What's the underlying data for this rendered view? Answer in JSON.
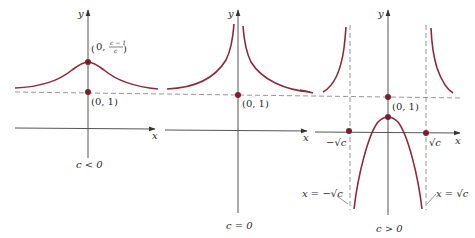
{
  "figure": {
    "colors": {
      "curve": "#8b2a3c",
      "point": "#7a1f33",
      "axis": "#555555",
      "asymptote": "#8a8a8a"
    },
    "shared": {
      "horizontal_asymptote": "y = 1 (dashed)"
    },
    "panels": [
      {
        "id": "c-negative",
        "caption": "c < 0",
        "x_axis_label": "x",
        "y_axis_label": "y",
        "points": [
          {
            "label_prefix": "(0, ",
            "label_num": "c − 1",
            "label_den": "c",
            "label_suffix": ")"
          },
          {
            "label": "(0, 1)"
          }
        ],
        "shape": "bell-shaped curve with maximum at (0, (c−1)/c), approaching y = 1"
      },
      {
        "id": "c-zero",
        "caption": "c = 0",
        "x_axis_label": "x",
        "y_axis_label": "y",
        "points": [
          {
            "label": "(0, 1)"
          }
        ],
        "shape": "two branches rising to infinity near x = 0, approaching y = 1"
      },
      {
        "id": "c-positive",
        "caption": "c > 0",
        "x_axis_label": "x",
        "y_axis_label": "y",
        "points": [
          {
            "label": "(0, 1)"
          },
          {
            "label": "−√c"
          },
          {
            "label": "√c"
          }
        ],
        "asymptotes": [
          {
            "label": "x = −√c"
          },
          {
            "label": "x = √c"
          }
        ],
        "shape": "outer branches rising at vertical asymptotes, inner downward branch between"
      }
    ]
  }
}
